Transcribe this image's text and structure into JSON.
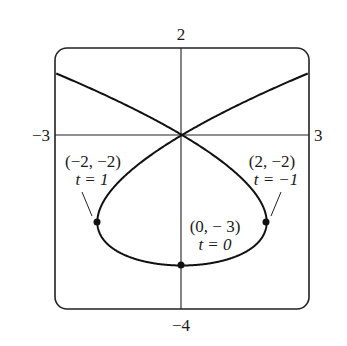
{
  "chart_data": {
    "type": "line",
    "title": "",
    "xlabel": "",
    "ylabel": "",
    "xlim": [
      -3,
      3
    ],
    "ylim": [
      -4,
      2
    ],
    "grid": false,
    "axis_labels": {
      "top": "2",
      "bottom": "−4",
      "left": "−3",
      "right": "3"
    },
    "curve": {
      "description": "parametric curve x = t^3 - 3t, y = t^2 - 3",
      "t_range": [
        -2.2,
        2.2
      ],
      "self_intersection": [
        0,
        0
      ]
    },
    "points": [
      {
        "x": -2,
        "y": -2,
        "t": 1,
        "label": "(−2, −2)",
        "t_label": "t = 1"
      },
      {
        "x": 2,
        "y": -2,
        "t": -1,
        "label": "(2, −2)",
        "t_label": "t = −1"
      },
      {
        "x": 0,
        "y": -3,
        "t": 0,
        "label": "(0, − 3)",
        "t_label": "t = 0"
      }
    ]
  }
}
